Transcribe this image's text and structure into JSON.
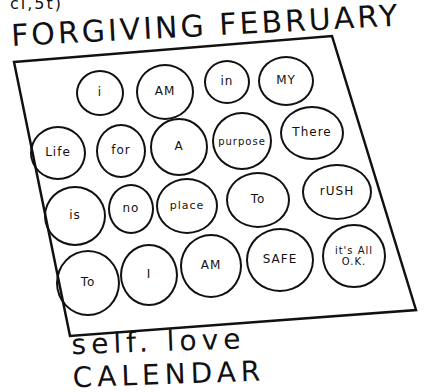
{
  "header": {
    "fragment": "ci,5t)",
    "title": "FORGIVING FEBRUARY"
  },
  "calendar": {
    "rows": [
      [
        "i",
        "AM",
        "in",
        "MY"
      ],
      [
        "Life",
        "for",
        "A",
        "purpose",
        "There"
      ],
      [
        "is",
        "no",
        "place",
        "To",
        "rUSH"
      ],
      [
        "To",
        "I",
        "AM",
        "SAFE",
        "it's All O.K."
      ]
    ]
  },
  "footer": {
    "caption": "self. love CALENDAR"
  }
}
